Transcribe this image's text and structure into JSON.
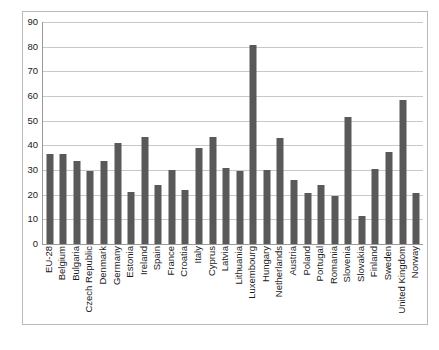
{
  "chart_data": {
    "type": "bar",
    "title": "",
    "subtitle": "",
    "xlabel": "",
    "ylabel": "",
    "ylim": [
      0,
      90
    ],
    "ytick_step": 10,
    "yticks": [
      0,
      10,
      20,
      30,
      40,
      50,
      60,
      70,
      80,
      90
    ],
    "ytick_labels": [
      "0",
      "10",
      "20",
      "30",
      "40",
      "50",
      "60",
      "70",
      "80",
      "90"
    ],
    "grid": "horizontal",
    "legend": "none",
    "bar_color": "#595959",
    "gridline_color": "#c8c8c8",
    "axis_color": "#9a9a9a",
    "border_color": "#b9b9b9",
    "background_color": "#ffffff",
    "categories": [
      "EU-28",
      "Belgium",
      "Bulgaria",
      "Czech Republic",
      "Denmark",
      "Germany",
      "Estonia",
      "Ireland",
      "Spain",
      "France",
      "Croatia",
      "Italy",
      "Cyprus",
      "Latvia",
      "Lithuania",
      "Luxembourg",
      "Hungary",
      "Netherlands",
      "Austria",
      "Poland",
      "Portugal",
      "Romania",
      "Slovenia",
      "Slovakia",
      "Finland",
      "Sweden",
      "United Kingdom",
      "Norway"
    ],
    "values": [
      36.3,
      36.5,
      33.8,
      29.4,
      33.8,
      41.0,
      21.0,
      43.5,
      24.0,
      30.2,
      22.0,
      39.0,
      43.5,
      30.8,
      29.8,
      80.5,
      30.2,
      43.0,
      26.0,
      20.5,
      24.0,
      19.5,
      51.5,
      11.5,
      30.5,
      37.5,
      58.5,
      20.5
    ]
  }
}
